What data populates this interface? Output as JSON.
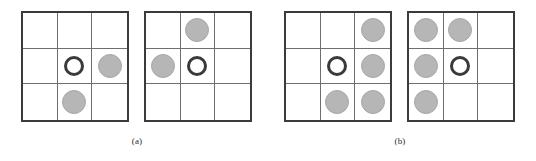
{
  "figure": {
    "panels": [
      {
        "caption": "(a)",
        "boards": [
          {
            "name": "board-1",
            "rows": [
              [
                "empty",
                "empty",
                "empty"
              ],
              [
                "empty",
                "ring",
                "filled"
              ],
              [
                "empty",
                "filled",
                "empty"
              ]
            ]
          },
          {
            "name": "board-2",
            "rows": [
              [
                "empty",
                "filled",
                "empty"
              ],
              [
                "filled",
                "ring",
                "empty"
              ],
              [
                "empty",
                "empty",
                "empty"
              ]
            ]
          }
        ]
      },
      {
        "caption": "(b)",
        "boards": [
          {
            "name": "board-3",
            "rows": [
              [
                "empty",
                "empty",
                "filled"
              ],
              [
                "empty",
                "ring",
                "filled"
              ],
              [
                "empty",
                "filled",
                "filled"
              ]
            ]
          },
          {
            "name": "board-4",
            "rows": [
              [
                "filled",
                "filled",
                "empty"
              ],
              [
                "filled",
                "ring",
                "empty"
              ],
              [
                "filled",
                "empty",
                "empty"
              ]
            ]
          }
        ]
      }
    ]
  },
  "colors": {
    "board_border": "#3b3b3b",
    "grid_line": "#6e6e6e",
    "token_filled": "#b6b6b6",
    "token_ring_stroke": "#3a3a3a",
    "background": "#ffffff",
    "caption_text": "#2b2b2b"
  },
  "tokens": {
    "filled_label": "filled-disc",
    "ring_label": "open-ring-disc",
    "empty_label": "empty-cell"
  },
  "captions": {
    "a": "(a)",
    "b": "(b)"
  }
}
